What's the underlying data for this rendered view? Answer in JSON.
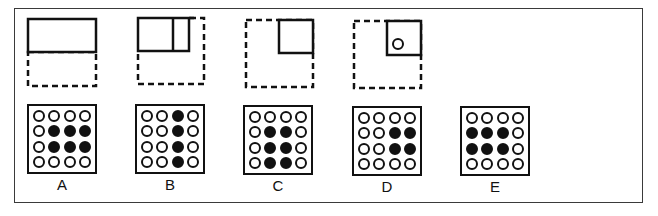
{
  "figure": {
    "colors": {
      "ink": "#111111",
      "frame": "#3a3a3a",
      "background": "#ffffff"
    },
    "fold_steps": [
      {
        "id": "step-1",
        "description": "Square paper folded top half down; solid rectangle on top half, dashed outline shows original square",
        "solid_shapes": [
          "top-half-rectangle"
        ],
        "punched_hole": false
      },
      {
        "id": "step-2",
        "description": "Folded again from right; solid rectangle with a vertical fold line, dashed outline of original square",
        "solid_shapes": [
          "top-rectangle-with-vertical-fold"
        ],
        "punched_hole": false
      },
      {
        "id": "step-3",
        "description": "Folded to top-right quarter square; dashed outline of original square",
        "solid_shapes": [
          "top-right-quarter-square"
        ],
        "punched_hole": false
      },
      {
        "id": "step-4",
        "description": "Hole punched in top-right quarter square near lower-left corner",
        "solid_shapes": [
          "top-right-quarter-square"
        ],
        "punched_hole": true
      }
    ],
    "options": [
      {
        "label": "A",
        "grid": [
          [
            0,
            0,
            0,
            0
          ],
          [
            0,
            1,
            1,
            1
          ],
          [
            0,
            1,
            1,
            1
          ],
          [
            0,
            0,
            0,
            0
          ]
        ]
      },
      {
        "label": "B",
        "grid": [
          [
            0,
            0,
            1,
            0
          ],
          [
            0,
            0,
            1,
            0
          ],
          [
            0,
            0,
            1,
            0
          ],
          [
            0,
            0,
            1,
            0
          ]
        ]
      },
      {
        "label": "C",
        "grid": [
          [
            0,
            0,
            0,
            0
          ],
          [
            0,
            1,
            1,
            0
          ],
          [
            0,
            1,
            1,
            0
          ],
          [
            0,
            1,
            1,
            0
          ]
        ]
      },
      {
        "label": "D",
        "grid": [
          [
            0,
            0,
            0,
            0
          ],
          [
            0,
            0,
            1,
            1
          ],
          [
            0,
            0,
            1,
            1
          ],
          [
            0,
            0,
            0,
            0
          ]
        ]
      },
      {
        "label": "E",
        "grid": [
          [
            0,
            0,
            0,
            0
          ],
          [
            1,
            1,
            1,
            0
          ],
          [
            1,
            1,
            1,
            0
          ],
          [
            0,
            0,
            0,
            0
          ]
        ]
      }
    ]
  }
}
